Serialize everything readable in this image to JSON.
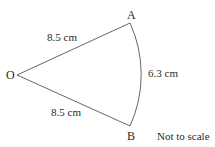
{
  "diagram": {
    "type": "sector",
    "points": {
      "O": {
        "label": "O"
      },
      "A": {
        "label": "A"
      },
      "B": {
        "label": "B"
      }
    },
    "radius_OA": "8.5 cm",
    "radius_OB": "8.5 cm",
    "arc_AB": "6.3 cm",
    "note": "Not to scale",
    "stroke_color": "#555555",
    "text_color": "#2a2a2a"
  }
}
